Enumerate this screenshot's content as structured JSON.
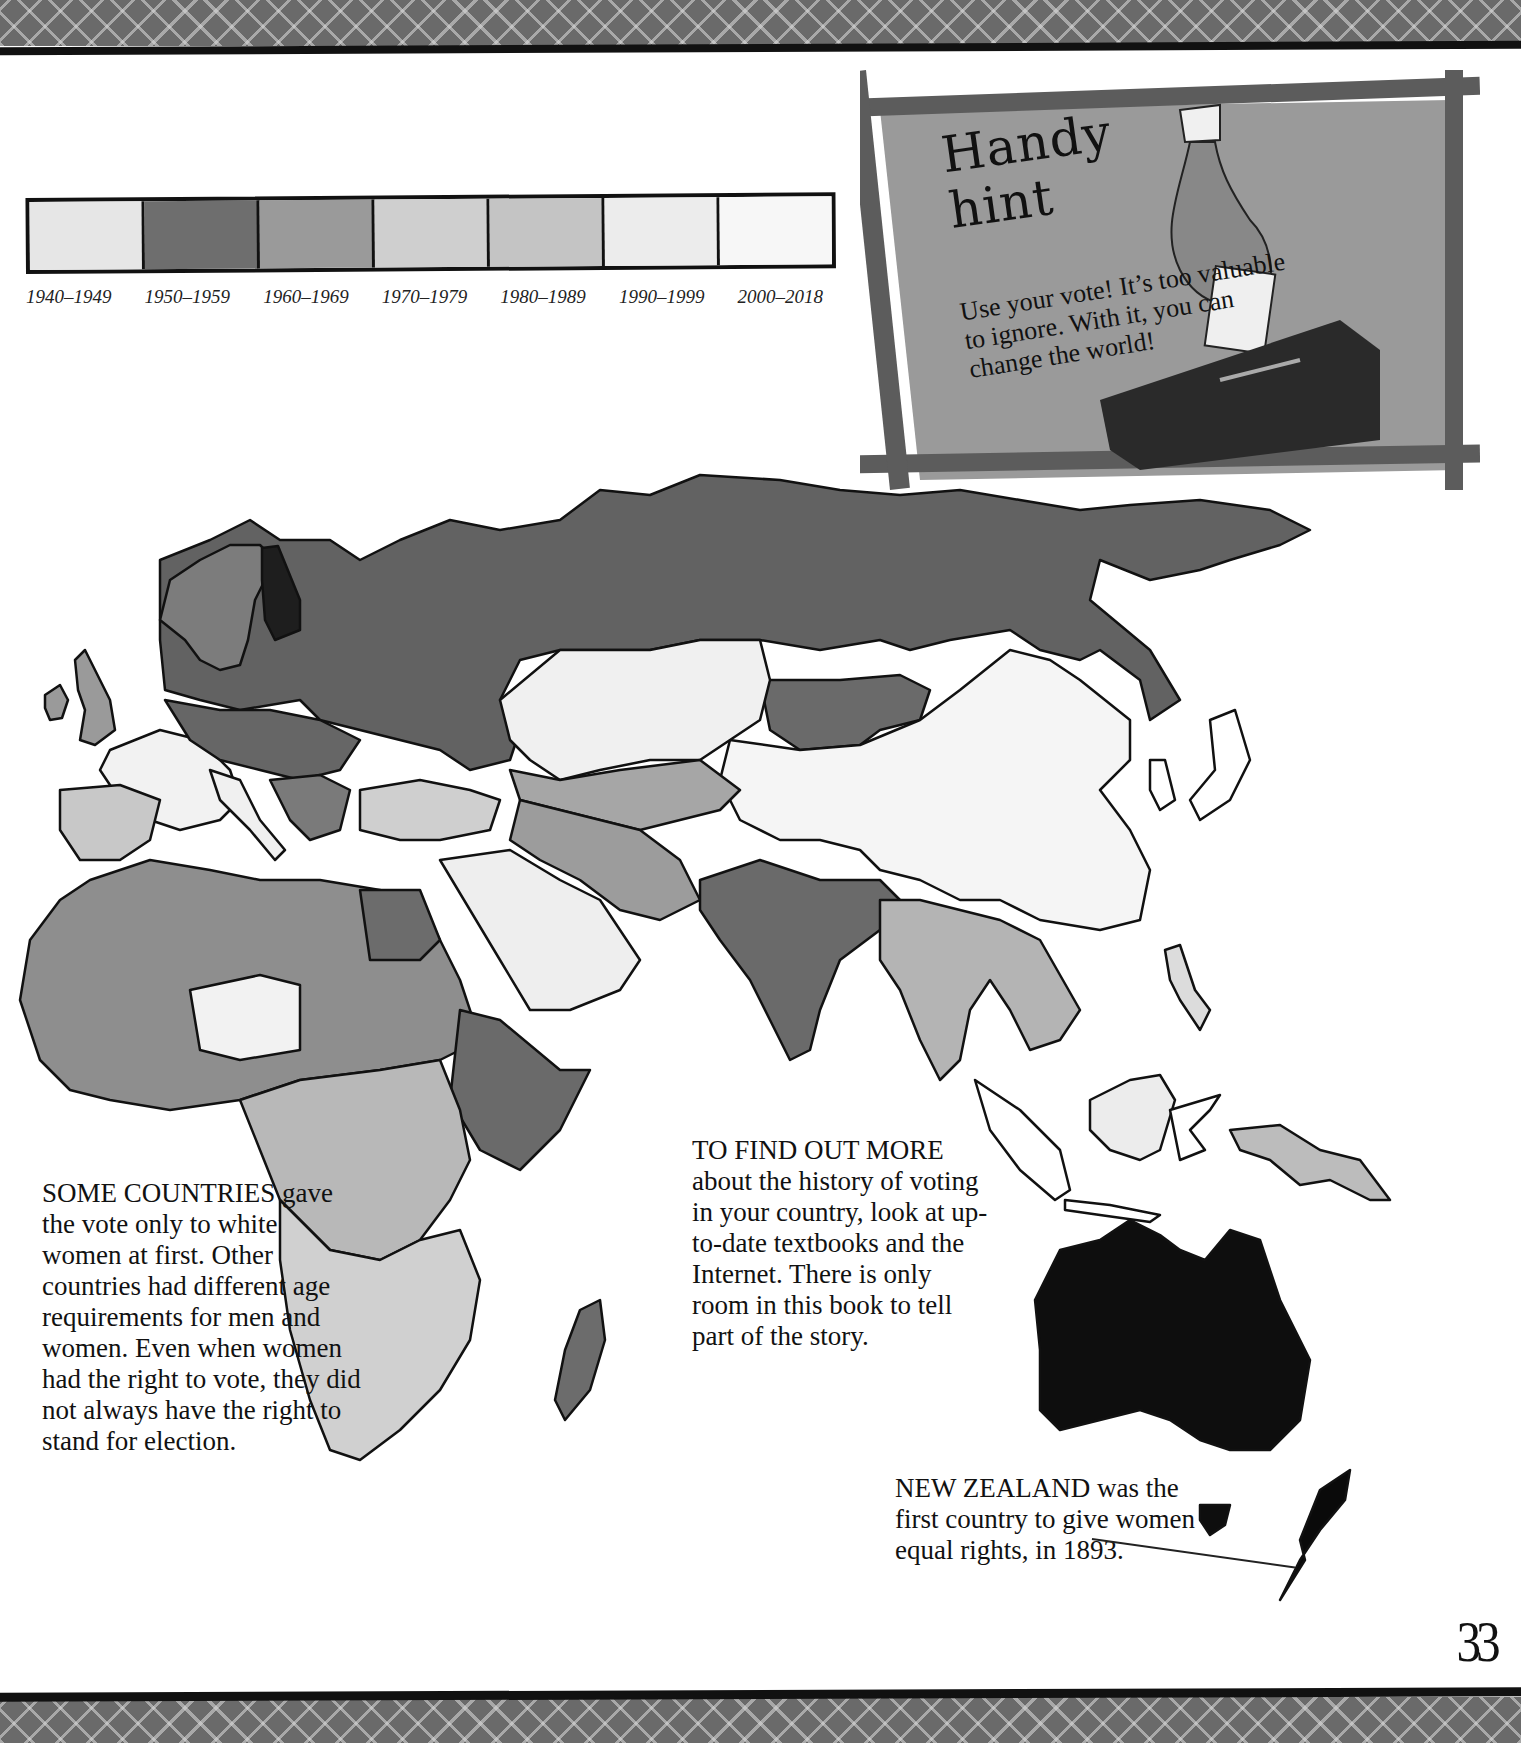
{
  "legend": {
    "title": "",
    "items": [
      {
        "label": "1940–1949",
        "color": "#e6e6e6"
      },
      {
        "label": "1950–1959",
        "color": "#6e6e6e"
      },
      {
        "label": "1960–1969",
        "color": "#9a9a9a"
      },
      {
        "label": "1970–1979",
        "color": "#cfcfcf"
      },
      {
        "label": "1980–1989",
        "color": "#c4c4c4"
      },
      {
        "label": "1990–1999",
        "color": "#ececec"
      },
      {
        "label": "2000–2018",
        "color": "#f7f7f7"
      }
    ]
  },
  "hint": {
    "title_line1": "Handy",
    "title_line2": "hint",
    "body": "Use your vote! It’s too valuable to ignore. With it, you can change the world!",
    "icon": "hand-voting-ballot-box-icon"
  },
  "map": {
    "subject": "Year women gained the right to vote",
    "regions_shown": [
      "Europe",
      "Asia",
      "Africa",
      "Middle East",
      "Southeast Asia",
      "Australia",
      "New Zealand"
    ],
    "colors": {
      "russia": "#626262",
      "finland": "#1e1e1e",
      "australia": "#0e0e0e",
      "new_zealand": "#0a0a0a",
      "china": "#f5f5f5",
      "mongolia": "#6a6a6a",
      "india": "#6a6a6a",
      "arabia": "#eeeeee"
    }
  },
  "text": {
    "some_countries": {
      "lead": "SOME COUNTRIES",
      "body": "gave the vote only to white women at first. Other countries had different age requirements for men and women. Even when women had the right to vote, they did not always have the right to stand for election."
    },
    "find_out": {
      "lead": "TO FIND OUT MORE",
      "body": "about the history of voting in your country, look at up-to-date textbooks and the Internet. There is only room in this book to tell part of the story."
    },
    "new_zealand": {
      "lead": "NEW ZEALAND",
      "body": "was the first country to give women equal rights, in 1893."
    }
  },
  "page": {
    "number": "33"
  }
}
